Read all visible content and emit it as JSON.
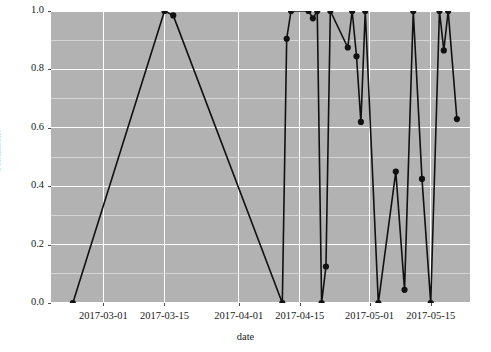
{
  "chart_data": {
    "type": "line",
    "title": "",
    "subtitle": "",
    "xlabel": "date",
    "ylabel": "sentiment",
    "grid": true,
    "legend": null,
    "marker": "filled-circle",
    "line_color": "#111111",
    "panel_color": "#b2b2b2",
    "grid_color": "#ffffff",
    "xlim": [
      "2017-02-17",
      "2017-05-24"
    ],
    "ylim": [
      0.0,
      1.0
    ],
    "y_ticks": [
      0.0,
      0.2,
      0.4,
      0.6,
      0.8,
      1.0
    ],
    "y_tick_labels": [
      "0.0",
      "0.2",
      "0.4",
      "0.6",
      "0.8",
      "1.0"
    ],
    "x_ticks": [
      "2017-03-01",
      "2017-03-15",
      "2017-04-01",
      "2017-04-15",
      "2017-05-01",
      "2017-05-15"
    ],
    "x_tick_labels": [
      "2017-03-01",
      "2017-03-15",
      "2017-04-01",
      "2017-04-15",
      "2017-05-01",
      "2017-05-15"
    ],
    "series": [
      {
        "name": "sentiment",
        "points": [
          {
            "date": "2017-02-22",
            "value": 0.0
          },
          {
            "date": "2017-03-15",
            "value": 1.0
          },
          {
            "date": "2017-03-17",
            "value": 0.985
          },
          {
            "date": "2017-04-11",
            "value": 0.0
          },
          {
            "date": "2017-04-12",
            "value": 0.905
          },
          {
            "date": "2017-04-13",
            "value": 1.0
          },
          {
            "date": "2017-04-17",
            "value": 1.0
          },
          {
            "date": "2017-04-18",
            "value": 0.975
          },
          {
            "date": "2017-04-19",
            "value": 1.0
          },
          {
            "date": "2017-04-20",
            "value": 0.0
          },
          {
            "date": "2017-04-21",
            "value": 0.125
          },
          {
            "date": "2017-04-22",
            "value": 1.0
          },
          {
            "date": "2017-04-26",
            "value": 0.875
          },
          {
            "date": "2017-04-27",
            "value": 1.0
          },
          {
            "date": "2017-04-28",
            "value": 0.845
          },
          {
            "date": "2017-04-29",
            "value": 0.62
          },
          {
            "date": "2017-04-30",
            "value": 1.0
          },
          {
            "date": "2017-05-03",
            "value": 0.0
          },
          {
            "date": "2017-05-07",
            "value": 0.45
          },
          {
            "date": "2017-05-09",
            "value": 0.045
          },
          {
            "date": "2017-05-11",
            "value": 1.0
          },
          {
            "date": "2017-05-13",
            "value": 0.425
          },
          {
            "date": "2017-05-15",
            "value": 0.0
          },
          {
            "date": "2017-05-17",
            "value": 1.0
          },
          {
            "date": "2017-05-18",
            "value": 0.865
          },
          {
            "date": "2017-05-19",
            "value": 1.0
          },
          {
            "date": "2017-05-21",
            "value": 0.63
          }
        ]
      }
    ]
  }
}
